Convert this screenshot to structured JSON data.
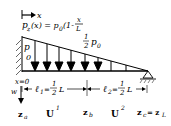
{
  "diagram": {
    "axis_x_label": "x",
    "load_function": {
      "lhs": "p",
      "lhs_sub": "z",
      "mid": "(x) = p",
      "mid_sub": "0",
      "paren": "(1-",
      "frac_num": "x",
      "frac_den": "L"
    },
    "left_load_label": {
      "main": "p",
      "sub": "0"
    },
    "mid_load_label": {
      "num": "1",
      "den": "2",
      "main": "p",
      "sub": "0"
    },
    "origin_label": "x=0",
    "deflection_label": "w",
    "segment1": {
      "main": "ℓ",
      "sub": "1",
      "eq": "=",
      "num": "1",
      "den": "2",
      "tail": "L"
    },
    "segment2": {
      "main": "ℓ",
      "sub": "2",
      "eq": "=",
      "num": "1",
      "den": "2",
      "tail": "L"
    },
    "nodes": [
      {
        "main": "z",
        "sub": "a"
      },
      {
        "main": "z",
        "sub": "b"
      },
      {
        "main": "z",
        "sub": "c",
        "eq": "= z",
        "eq_sub": "L"
      }
    ],
    "elements": [
      {
        "main": "U",
        "sup": "1"
      },
      {
        "main": "U",
        "sup": "2"
      }
    ]
  }
}
